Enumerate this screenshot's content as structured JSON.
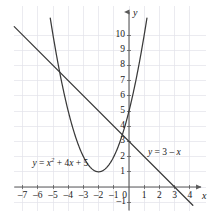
{
  "chart_data": {
    "type": "line",
    "title": "",
    "xlabel": "x",
    "ylabel": "y",
    "xlim": [
      -7.6,
      4.8
    ],
    "ylim": [
      -1.6,
      10.8
    ],
    "grid": true,
    "grid_color": "#e2e2ea",
    "axis_color": "#5a5a5a",
    "curve_color": "#3a3a3a",
    "legend": "inline-labels",
    "x_ticks": [
      -7,
      -6,
      -5,
      -4,
      -3,
      -2,
      -1,
      0,
      1,
      2,
      3,
      4
    ],
    "x_tick_labels": [
      "–7",
      "–6",
      "–5",
      "–4",
      "–3",
      "–2",
      "–1",
      "0",
      "1",
      "2",
      "3",
      "4"
    ],
    "y_ticks": [
      -1,
      1,
      2,
      3,
      4,
      5,
      6,
      7,
      8,
      9,
      10
    ],
    "y_tick_labels": [
      "–1",
      "1",
      "2",
      "3",
      "4",
      "5",
      "6",
      "7",
      "8",
      "9",
      "10"
    ],
    "origin_label": "0",
    "series": [
      {
        "name": "parabola",
        "type": "quadratic",
        "equation_text": "y = x² + 4x + 5",
        "label_parts": {
          "lhs": "y",
          "eq": "=",
          "base": "x",
          "exponent": "2",
          "rest": "+ 4x + 5"
        },
        "coefficients": {
          "a": 1,
          "b": 4,
          "c": 5
        },
        "vertex": [
          -2,
          1
        ],
        "y_intercept": 5,
        "label_position": [
          -6.35,
          1.85
        ]
      },
      {
        "name": "line",
        "type": "linear",
        "equation_text": "y = 3 – x",
        "label_parts": {
          "lhs": "y",
          "eq": "=",
          "rest": "3 – x"
        },
        "coefficients": {
          "m": -1,
          "b": 3
        },
        "x_intercept": 3,
        "y_intercept": 3,
        "label_position": [
          1.25,
          2.55
        ]
      }
    ],
    "intersections": [
      {
        "x": -4.56,
        "y": 7.56
      },
      {
        "x": 0.44,
        "y": 2.56
      }
    ]
  }
}
